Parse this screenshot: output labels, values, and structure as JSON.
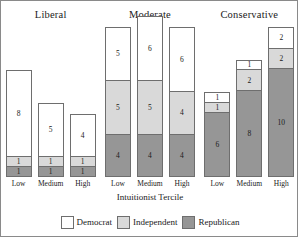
{
  "chart_data": {
    "type": "bar",
    "title": "",
    "xlabel": "Intuitionist Tercile",
    "ylabel": "",
    "stacked": true,
    "grid": false,
    "legend_position": "bottom",
    "ylim": [
      0,
      14
    ],
    "categories": [
      "Low",
      "Medium",
      "High"
    ],
    "facets": [
      "Liberal",
      "Moderate",
      "Conservative"
    ],
    "series": [
      {
        "name": "Democrat",
        "color": "#ffffff",
        "values": {
          "Liberal": [
            8,
            5,
            4
          ],
          "Moderate": [
            5,
            6,
            6
          ],
          "Conservative": [
            1,
            1,
            2
          ]
        }
      },
      {
        "name": "Independent",
        "color": "#d9d9d9",
        "values": {
          "Liberal": [
            1,
            1,
            1
          ],
          "Moderate": [
            5,
            5,
            4
          ],
          "Conservative": [
            1,
            2,
            2
          ]
        }
      },
      {
        "name": "Republican",
        "color": "#969696",
        "values": {
          "Liberal": [
            1,
            1,
            1
          ],
          "Moderate": [
            4,
            4,
            4
          ],
          "Conservative": [
            6,
            8,
            10
          ]
        }
      }
    ]
  },
  "panels": [
    {
      "title": "Liberal",
      "bars": [
        {
          "tick": "Low",
          "segments": [
            {
              "series": "Republican",
              "value": 1,
              "label": "1"
            },
            {
              "series": "Independent",
              "value": 1,
              "label": "1"
            },
            {
              "series": "Democrat",
              "value": 8,
              "label": "8"
            }
          ]
        },
        {
          "tick": "Medium",
          "segments": [
            {
              "series": "Republican",
              "value": 1,
              "label": "1"
            },
            {
              "series": "Independent",
              "value": 1,
              "label": "1"
            },
            {
              "series": "Democrat",
              "value": 5,
              "label": "5"
            }
          ]
        },
        {
          "tick": "High",
          "segments": [
            {
              "series": "Republican",
              "value": 1,
              "label": "1"
            },
            {
              "series": "Independent",
              "value": 1,
              "label": "1"
            },
            {
              "series": "Democrat",
              "value": 4,
              "label": "4"
            }
          ]
        }
      ]
    },
    {
      "title": "Moderate",
      "bars": [
        {
          "tick": "Low",
          "segments": [
            {
              "series": "Republican",
              "value": 4,
              "label": "4"
            },
            {
              "series": "Independent",
              "value": 5,
              "label": "5"
            },
            {
              "series": "Democrat",
              "value": 5,
              "label": "5"
            }
          ]
        },
        {
          "tick": "Medium",
          "segments": [
            {
              "series": "Republican",
              "value": 4,
              "label": "4"
            },
            {
              "series": "Independent",
              "value": 5,
              "label": "5"
            },
            {
              "series": "Democrat",
              "value": 6,
              "label": "6"
            }
          ]
        },
        {
          "tick": "High",
          "segments": [
            {
              "series": "Republican",
              "value": 4,
              "label": "4"
            },
            {
              "series": "Independent",
              "value": 4,
              "label": "4"
            },
            {
              "series": "Democrat",
              "value": 6,
              "label": "6"
            }
          ]
        }
      ]
    },
    {
      "title": "Conservative",
      "bars": [
        {
          "tick": "Low",
          "segments": [
            {
              "series": "Republican",
              "value": 6,
              "label": "6"
            },
            {
              "series": "Independent",
              "value": 1,
              "label": "1"
            },
            {
              "series": "Democrat",
              "value": 1,
              "label": "1"
            }
          ]
        },
        {
          "tick": "Medium",
          "segments": [
            {
              "series": "Republican",
              "value": 8,
              "label": "8"
            },
            {
              "series": "Independent",
              "value": 2,
              "label": "2"
            },
            {
              "series": "Democrat",
              "value": 1,
              "label": "1"
            }
          ]
        },
        {
          "tick": "High",
          "segments": [
            {
              "series": "Republican",
              "value": 10,
              "label": "10"
            },
            {
              "series": "Independent",
              "value": 2,
              "label": "2"
            },
            {
              "series": "Democrat",
              "value": 2,
              "label": "2"
            }
          ]
        }
      ]
    }
  ],
  "axis": {
    "xlabel": "Intuitionist Tercile"
  },
  "legend": {
    "items": [
      {
        "label": "Democrat",
        "color": "#ffffff"
      },
      {
        "label": "Independent",
        "color": "#d9d9d9"
      },
      {
        "label": "Republican",
        "color": "#969696"
      }
    ]
  },
  "style": {
    "max_stack_total": 14,
    "plot_height_px": 152,
    "segment_border": "#6e6e6e"
  }
}
